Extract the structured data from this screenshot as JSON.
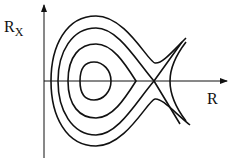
{
  "diagram": {
    "type": "phase-portrait",
    "axes": {
      "y_label": "R",
      "y_label_subscript": "X",
      "x_label": "R"
    },
    "curves": [
      {
        "name": "inner-closed-orbit"
      },
      {
        "name": "middle-closed-orbit"
      },
      {
        "name": "separatrix-loop"
      },
      {
        "name": "outer-open-trajectory"
      },
      {
        "name": "right-hyperbolic-branch"
      }
    ],
    "colors": {
      "stroke": "#111111",
      "background": "#ffffff"
    }
  }
}
